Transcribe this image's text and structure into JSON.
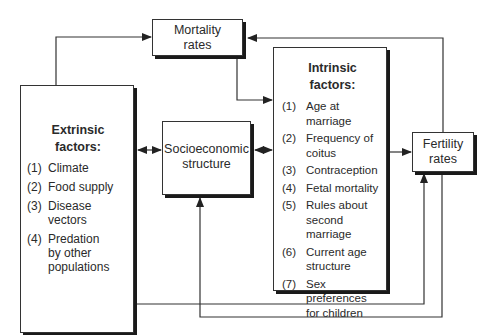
{
  "diagram": {
    "nodes": {
      "mortality": {
        "label_line1": "Mortality",
        "label_line2": "rates"
      },
      "extrinsic": {
        "title_line1": "Extrinsic",
        "title_line2": "factors:",
        "items": [
          {
            "num": "(1)",
            "text": "Climate"
          },
          {
            "num": "(2)",
            "text": "Food supply"
          },
          {
            "num": "(3)",
            "text": "Disease vectors"
          },
          {
            "num": "(4)",
            "text": "Predation by other populations"
          }
        ]
      },
      "socioeconomic": {
        "label_line1": "Socioeconomic",
        "label_line2": "structure"
      },
      "intrinsic": {
        "title_line1": "Intrinsic",
        "title_line2": "factors:",
        "items": [
          {
            "num": "(1)",
            "text": "Age at marriage"
          },
          {
            "num": "(2)",
            "text": "Frequency of coitus"
          },
          {
            "num": "(3)",
            "text": "Contraception"
          },
          {
            "num": "(4)",
            "text": "Fetal mortality"
          },
          {
            "num": "(5)",
            "text": "Rules about second marriage"
          },
          {
            "num": "(6)",
            "text": "Current age structure"
          },
          {
            "num": "(7)",
            "text": "Sex preferences for children"
          }
        ]
      },
      "fertility": {
        "label_line1": "Fertility",
        "label_line2": "rates"
      }
    },
    "edges": [
      {
        "from": "extrinsic",
        "to": "mortality",
        "direction": "one-way"
      },
      {
        "from": "mortality",
        "to": "intrinsic",
        "direction": "one-way"
      },
      {
        "from": "fertility",
        "to": "mortality",
        "direction": "one-way"
      },
      {
        "from": "extrinsic",
        "to": "socioeconomic",
        "direction": "two-way"
      },
      {
        "from": "socioeconomic",
        "to": "intrinsic",
        "direction": "two-way"
      },
      {
        "from": "intrinsic",
        "to": "fertility",
        "direction": "one-way"
      },
      {
        "from": "extrinsic",
        "to": "fertility",
        "direction": "one-way"
      },
      {
        "from": "fertility",
        "to": "socioeconomic",
        "direction": "one-way"
      }
    ]
  }
}
